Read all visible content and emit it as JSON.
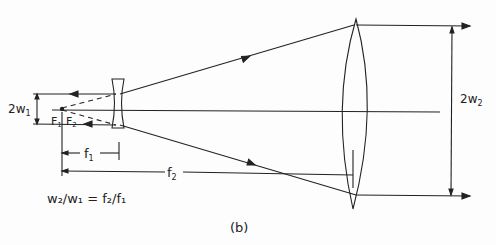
{
  "figure": {
    "panel_label": "(b)",
    "equation": "w₂/w₁ = f₂/f₁",
    "labels": {
      "input_width": "2w",
      "input_width_sub": "1",
      "output_width": "2w",
      "output_width_sub": "2",
      "focal_point_1": "F",
      "focal_point_1_sub": "1",
      "focal_point_2": "F",
      "focal_point_2_sub": "2",
      "focal_length_1": "f",
      "focal_length_1_sub": "1",
      "focal_length_2": "f",
      "focal_length_2_sub": "2"
    },
    "colors": {
      "line": "#222222",
      "background": "#fdfdfd"
    }
  }
}
